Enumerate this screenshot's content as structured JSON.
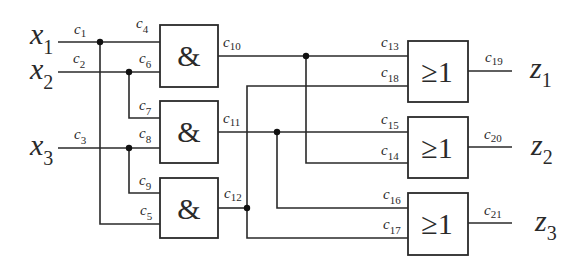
{
  "diagram": {
    "type": "logic-circuit",
    "inputs": [
      {
        "id": "x1",
        "base": "x",
        "sub": "1"
      },
      {
        "id": "x2",
        "base": "x",
        "sub": "2"
      },
      {
        "id": "x3",
        "base": "x",
        "sub": "3"
      }
    ],
    "outputs": [
      {
        "id": "z1",
        "base": "z",
        "sub": "1"
      },
      {
        "id": "z2",
        "base": "z",
        "sub": "2"
      },
      {
        "id": "z3",
        "base": "z",
        "sub": "3"
      }
    ],
    "and_gates": [
      {
        "symbol": "&",
        "inputs": [
          "c4",
          "c6"
        ],
        "output": "c10"
      },
      {
        "symbol": "&",
        "inputs": [
          "c7",
          "c8"
        ],
        "output": "c11"
      },
      {
        "symbol": "&",
        "inputs": [
          "c9",
          "c5"
        ],
        "output": "c12"
      }
    ],
    "or_gates": [
      {
        "symbol": "≥1",
        "inputs": [
          "c13",
          "c18"
        ],
        "output": "c19"
      },
      {
        "symbol": "≥1",
        "inputs": [
          "c15",
          "c14"
        ],
        "output": "c20"
      },
      {
        "symbol": "≥1",
        "inputs": [
          "c16",
          "c17"
        ],
        "output": "c21"
      }
    ],
    "wire_labels": {
      "c1": {
        "base": "c",
        "sub": "1"
      },
      "c2": {
        "base": "c",
        "sub": "2"
      },
      "c3": {
        "base": "c",
        "sub": "3"
      },
      "c4": {
        "base": "c",
        "sub": "4"
      },
      "c5": {
        "base": "c",
        "sub": "5"
      },
      "c6": {
        "base": "c",
        "sub": "6"
      },
      "c7": {
        "base": "c",
        "sub": "7"
      },
      "c8": {
        "base": "c",
        "sub": "8"
      },
      "c9": {
        "base": "c",
        "sub": "9"
      },
      "c10": {
        "base": "c",
        "sub": "10"
      },
      "c11": {
        "base": "c",
        "sub": "11"
      },
      "c12": {
        "base": "c",
        "sub": "12"
      },
      "c13": {
        "base": "c",
        "sub": "13"
      },
      "c14": {
        "base": "c",
        "sub": "14"
      },
      "c15": {
        "base": "c",
        "sub": "15"
      },
      "c16": {
        "base": "c",
        "sub": "16"
      },
      "c17": {
        "base": "c",
        "sub": "17"
      },
      "c18": {
        "base": "c",
        "sub": "18"
      },
      "c19": {
        "base": "c",
        "sub": "19"
      },
      "c20": {
        "base": "c",
        "sub": "20"
      },
      "c21": {
        "base": "c",
        "sub": "21"
      }
    },
    "and_symbol": "&",
    "or_symbol_ge": "≥",
    "or_symbol_one": "1"
  }
}
